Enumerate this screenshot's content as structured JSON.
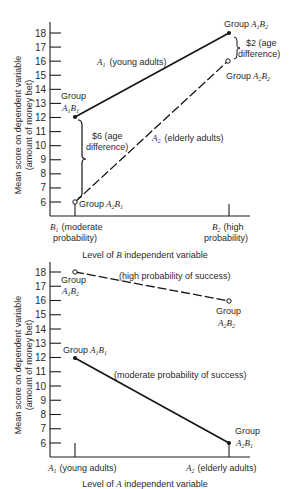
{
  "chart_data": [
    {
      "type": "line",
      "title": "",
      "xlabel": "Level of B independent variable",
      "ylabel": "Mean score on dependent variable (amount of money bet)",
      "ylim": [
        5,
        18.5
      ],
      "yticks": [
        6,
        7,
        8,
        9,
        10,
        11,
        12,
        13,
        14,
        15,
        16,
        17,
        18
      ],
      "grid": false,
      "categories": [
        "B1 (moderate probability)",
        "B2 (high probability)"
      ],
      "series": [
        {
          "name": "A1 (young adults)",
          "values": [
            12,
            18
          ],
          "style": "solid",
          "marker": "filled"
        },
        {
          "name": "A2 (elderly adults)",
          "values": [
            6,
            16
          ],
          "style": "dashed",
          "marker": "open"
        }
      ],
      "annotations": [
        {
          "text": "Group A1B1",
          "x": "B1",
          "y": 12
        },
        {
          "text": "Group A1B2",
          "x": "B2",
          "y": 18
        },
        {
          "text": "Group A2B1",
          "x": "B1",
          "y": 6
        },
        {
          "text": "Group A2B2",
          "x": "B2",
          "y": 16
        },
        {
          "text": "$6 (age difference)",
          "x": "B1",
          "range": [
            6,
            12
          ]
        },
        {
          "text": "$2 (age difference)",
          "x": "B2",
          "range": [
            16,
            18
          ]
        }
      ]
    },
    {
      "type": "line",
      "title": "",
      "xlabel": "Level of A independent variable",
      "ylabel": "Mean score on dependent variable (amount of money bet)",
      "ylim": [
        5,
        18.5
      ],
      "yticks": [
        6,
        7,
        8,
        9,
        10,
        11,
        12,
        13,
        14,
        15,
        16,
        17,
        18
      ],
      "grid": false,
      "categories": [
        "A1 (young adults)",
        "A2 (elderly adults)"
      ],
      "series": [
        {
          "name": "(high probability of success)",
          "values": [
            18,
            16
          ],
          "style": "dashed",
          "marker": "open"
        },
        {
          "name": "(moderate probability of success)",
          "values": [
            12,
            6
          ],
          "style": "solid",
          "marker": "filled"
        }
      ],
      "annotations": [
        {
          "text": "Group A1B2",
          "x": "A1",
          "y": 18
        },
        {
          "text": "Group A2B2",
          "x": "A2",
          "y": 16
        },
        {
          "text": "Group A1B1",
          "x": "A1",
          "y": 12
        },
        {
          "text": "Group A2B1",
          "x": "A2",
          "y": 6
        }
      ]
    }
  ],
  "top": {
    "ylabel_line1": "Mean score on dependent variable",
    "ylabel_line2": "(amount of money bet)",
    "xlabel_pre": "Level of ",
    "xlabel_var": "B",
    "xlabel_post": " independent variable",
    "cat1_var": "B",
    "cat1_sub": "1",
    "cat1_line1": "(moderate",
    "cat1_line2": "probability)",
    "cat2_var": "B",
    "cat2_sub": "2",
    "cat2_line1": "(high",
    "cat2_line2": "probability)",
    "series1_var": "A",
    "series1_sub": "1",
    "series1_label": "(young adults)",
    "series2_var": "A",
    "series2_sub": "2",
    "series2_label": "(elderly adults)",
    "group_word": "Group",
    "diff6_line1": "$6 (age",
    "diff6_line2": "difference)",
    "diff2_line1": "$2 (age",
    "diff2_line2": "difference)"
  },
  "bottom": {
    "ylabel_line1": "Mean score on dependent variable",
    "ylabel_line2": "(amount of money bet)",
    "xlabel_pre": "Level of ",
    "xlabel_var": "A",
    "xlabel_post": " independent variable",
    "cat1_var": "A",
    "cat1_sub": "1",
    "cat1_label": "(young adults)",
    "cat2_var": "A",
    "cat2_sub": "2",
    "cat2_label": "(elderly adults)",
    "high_label": "(high probability of success)",
    "moderate_label": "(moderate probability of success)",
    "group_word": "Group"
  }
}
